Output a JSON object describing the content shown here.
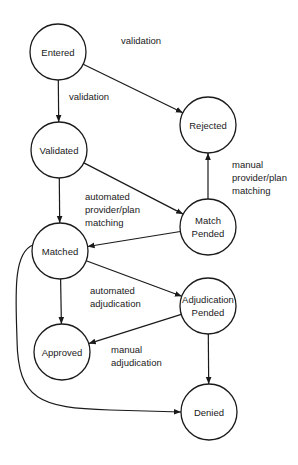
{
  "colors": {
    "stroke": "#1a1a1a",
    "background": "#ffffff"
  },
  "nodes": [
    {
      "id": "entered",
      "lines": [
        "Entered"
      ]
    },
    {
      "id": "rejected",
      "lines": [
        "Rejected"
      ]
    },
    {
      "id": "validated",
      "lines": [
        "Validated"
      ]
    },
    {
      "id": "match_pended",
      "lines": [
        "Match",
        "Pended"
      ]
    },
    {
      "id": "matched",
      "lines": [
        "Matched"
      ]
    },
    {
      "id": "adjudication_pended",
      "lines": [
        "Adjudication",
        "Pended"
      ]
    },
    {
      "id": "approved",
      "lines": [
        "Approved"
      ]
    },
    {
      "id": "denied",
      "lines": [
        "Denied"
      ]
    }
  ],
  "edges": [
    {
      "from": "entered",
      "to": "validated",
      "label": [
        "validation"
      ]
    },
    {
      "from": "entered",
      "to": "rejected",
      "label": [
        "validation"
      ]
    },
    {
      "from": "validated",
      "to": "matched",
      "label": []
    },
    {
      "from": "validated",
      "to": "match_pended",
      "label": [
        "automated",
        "provider/plan",
        "matching"
      ]
    },
    {
      "from": "match_pended",
      "to": "rejected",
      "label": [
        "manual",
        "provider/plan",
        "matching"
      ]
    },
    {
      "from": "match_pended",
      "to": "matched",
      "label": []
    },
    {
      "from": "matched",
      "to": "approved",
      "label": []
    },
    {
      "from": "matched",
      "to": "adjudication_pended",
      "label": [
        "automated",
        "adjudication"
      ]
    },
    {
      "from": "adjudication_pended",
      "to": "approved",
      "label": [
        "manual",
        "adjudication"
      ]
    },
    {
      "from": "adjudication_pended",
      "to": "denied",
      "label": []
    },
    {
      "from": "matched",
      "to": "denied",
      "label": []
    }
  ]
}
